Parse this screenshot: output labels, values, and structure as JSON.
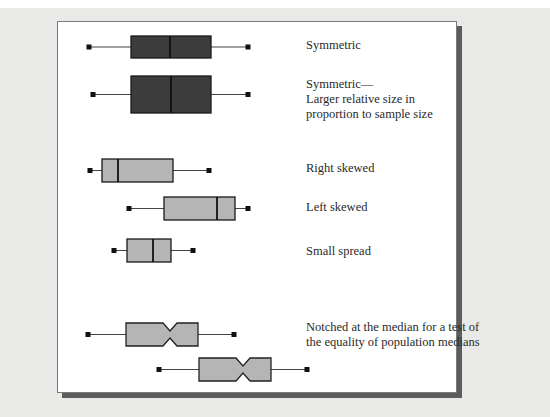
{
  "figure": {
    "background_color": "#e9e9e7",
    "panel_color": "#ffffff",
    "dark_fill": "#3c3c3c",
    "light_fill": "#b5b5b5"
  },
  "labels": [
    {
      "text": "Symmetric",
      "x": 306,
      "y": 38
    },
    {
      "text": "Symmetric—\nLarger relative size in\nproportion to sample size",
      "x": 306,
      "y": 77
    },
    {
      "text": "Right skewed",
      "x": 306,
      "y": 161
    },
    {
      "text": "Left skewed",
      "x": 306,
      "y": 200
    },
    {
      "text": "Small spread",
      "x": 306,
      "y": 244
    },
    {
      "text": "Notched at the median for a test of\nthe equality of population medians",
      "x": 306,
      "y": 320
    }
  ],
  "chart_data": {
    "type": "boxplot",
    "title": "",
    "xlabel": "",
    "ylabel": "",
    "grid": false,
    "boxes": [
      {
        "name": "Symmetric",
        "min": 89,
        "q1": 131,
        "median": 170,
        "q3": 211,
        "max": 248,
        "y_top": 36,
        "y_bottom": 58,
        "fill": "dark",
        "notched": false
      },
      {
        "name": "Symmetric — larger relative size in proportion to sample size",
        "min": 93,
        "q1": 131,
        "median": 171,
        "q3": 211,
        "max": 248,
        "y_top": 76,
        "y_bottom": 113,
        "fill": "dark",
        "notched": false
      },
      {
        "name": "Right skewed",
        "min": 90,
        "q1": 102,
        "median": 118,
        "q3": 173,
        "max": 209,
        "y_top": 159,
        "y_bottom": 182,
        "fill": "light",
        "notched": false
      },
      {
        "name": "Left skewed",
        "min": 129,
        "q1": 164,
        "median": 217,
        "q3": 235,
        "max": 248,
        "y_top": 197,
        "y_bottom": 220,
        "fill": "light",
        "notched": false
      },
      {
        "name": "Small spread",
        "min": 114,
        "q1": 127,
        "median": 153,
        "q3": 171,
        "max": 193,
        "y_top": 239,
        "y_bottom": 262,
        "fill": "light",
        "notched": false
      },
      {
        "name": "Notched A",
        "min": 88,
        "q1": 126,
        "median": 170,
        "q3": 198,
        "max": 234,
        "y_top": 323,
        "y_bottom": 346,
        "fill": "light",
        "notched": true
      },
      {
        "name": "Notched B",
        "min": 159,
        "q1": 199,
        "median": 243,
        "q3": 271,
        "max": 307,
        "y_top": 358,
        "y_bottom": 381,
        "fill": "light",
        "notched": true
      }
    ]
  }
}
